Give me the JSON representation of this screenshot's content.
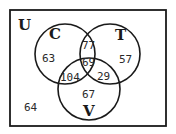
{
  "diagram": {
    "type": "venn-3",
    "universe": {
      "label": "U",
      "outside_count": "64"
    },
    "sets": [
      {
        "id": "C",
        "label": "C",
        "only_count": "63"
      },
      {
        "id": "T",
        "label": "T",
        "only_count": "57"
      },
      {
        "id": "V",
        "label": "V",
        "only_count": "67"
      }
    ],
    "intersections": {
      "C_T_only": "77",
      "C_V_only": "104",
      "T_V_only": "29",
      "C_T_V": "69"
    }
  }
}
